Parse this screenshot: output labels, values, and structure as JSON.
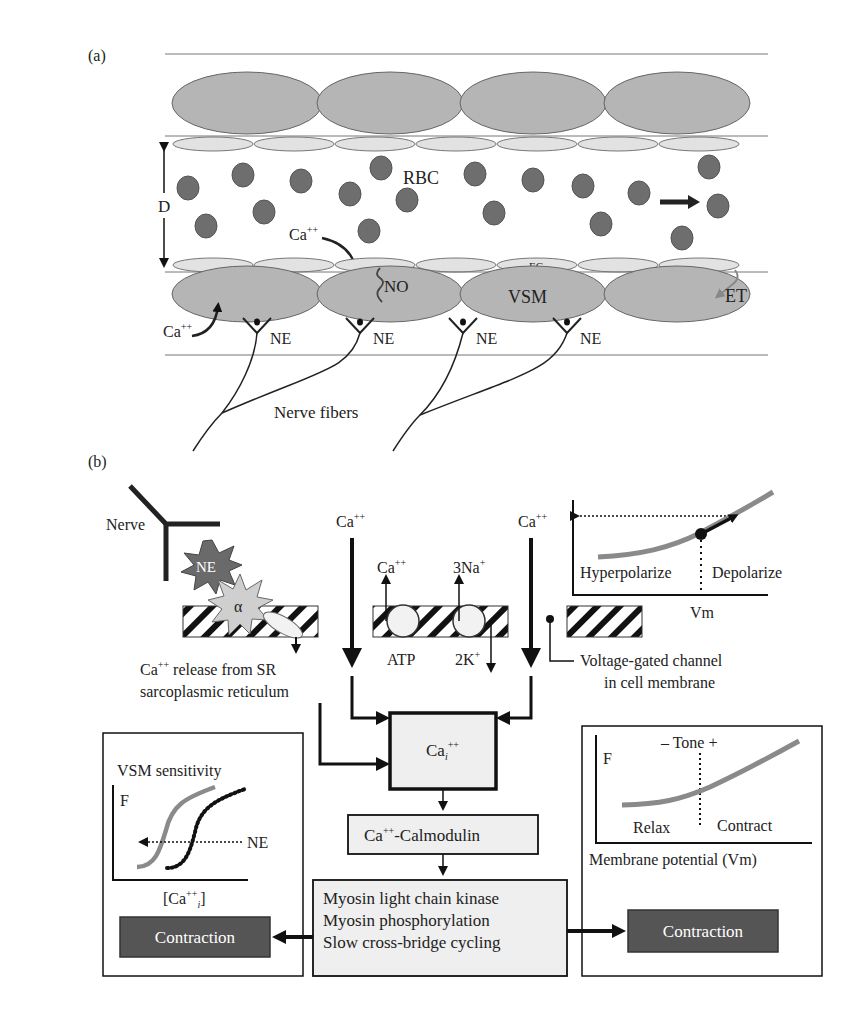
{
  "panel_a": {
    "label": "(a)",
    "rbc_label": "RBC",
    "diameter_label": "D",
    "ca_label_1": "Ca",
    "ca_label_1_sup": "++",
    "ca_label_2": "Ca",
    "ca_label_2_sup": "++",
    "no_label": "NO",
    "ec_label": "EC",
    "vsm_label": "VSM",
    "et_label": "ET",
    "ne_labels": [
      "NE",
      "NE",
      "NE",
      "NE"
    ],
    "nerve_fibers_label": "Nerve fibers"
  },
  "panel_b": {
    "label": "(b)",
    "nerve_label": "Nerve",
    "ne_star_label": "NE",
    "alpha_label": "α",
    "ca_left": "Ca",
    "ca_left_sup": "++",
    "ca_right": "Ca",
    "ca_right_sup": "++",
    "pump_ca": "Ca",
    "pump_ca_sup": "++",
    "pump_na": "3Na",
    "pump_na_sup": "+",
    "atp_label": "ATP",
    "k_label": "2K",
    "k_label_sup": "+",
    "sr_release_line1": "Ca",
    "sr_release_line1_sup": "++",
    "sr_release_line1_rest": " release from SR",
    "sr_release_line2": "sarcoplasmic reticulum",
    "voltage_channel_line1": "Voltage-gated channel",
    "voltage_channel_line2": "in cell membrane",
    "vm_graph": {
      "hyper_label": "Hyperpolarize",
      "depol_label": "Depolarize",
      "x_label": "Vm"
    },
    "cai_box": {
      "main": "Ca",
      "sub": "i",
      "sup": "++"
    },
    "calmodulin_box": {
      "pre": "Ca",
      "sup": "++",
      "rest": "-Calmodulin"
    },
    "myosin_box": {
      "lines": [
        "Myosin light chain kinase",
        "Myosin phosphorylation",
        "Slow cross-bridge cycling"
      ]
    },
    "sensitivity_panel": {
      "title": "VSM sensitivity",
      "y_label": "F",
      "ne_label": "NE",
      "x_label_pre": "[Ca",
      "x_label_sup": "++",
      "x_label_sub": "i",
      "x_label_post": "]"
    },
    "tone_panel": {
      "title": "– Tone +",
      "y_label": "F",
      "relax_label": "Relax",
      "contract_label": "Contract",
      "x_label": "Membrane potential (Vm)"
    },
    "contraction_left": "Contraction",
    "contraction_right": "Contraction"
  },
  "colors": {
    "smooth_muscle": "#b5b5b5",
    "endothelium": "#e2e2e2",
    "rbc": "#6e6e6e",
    "curve": "#8a8a8a",
    "box_fill": "#efefef",
    "contraction_fill": "#555555",
    "ne_star": "#6a6a6a",
    "alpha_star": "#cfcfcf"
  }
}
